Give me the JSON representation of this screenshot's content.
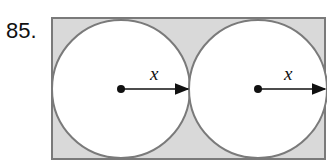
{
  "problem": {
    "number": "85."
  },
  "diagram": {
    "fill_color": "#d9d9d9",
    "stroke_color": "#7a7a7a",
    "circles": [
      {
        "radius_label": "x"
      },
      {
        "radius_label": "x"
      }
    ]
  }
}
